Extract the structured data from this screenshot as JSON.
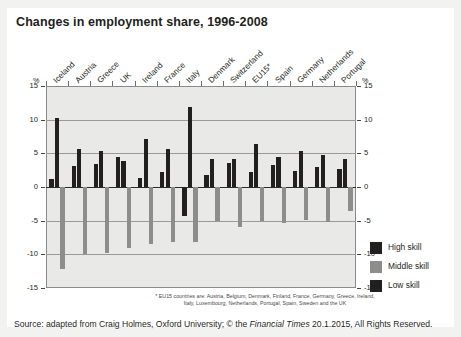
{
  "title": "Changes in employment share, 1996-2008",
  "axis": {
    "unit_symbol_left": "%",
    "unit_symbol_right": "%",
    "ticks": [
      "15",
      "10",
      "5",
      "0",
      "-5",
      "-10",
      "-15"
    ],
    "tick_values": [
      15,
      10,
      5,
      0,
      -5,
      -10,
      -15
    ],
    "min": -15,
    "max": 15
  },
  "legend": {
    "items": [
      {
        "label": "High skill",
        "color": "#221f1f"
      },
      {
        "label": "Middle skill",
        "color": "#8d8d8b"
      },
      {
        "label": "Low skill",
        "color": "#221f1f"
      }
    ]
  },
  "footnote": "* EU15 countries are: Austria, Belgium, Denmark, Finland, France, Germany, Greece, Ireland, Italy, Luxembourg, Netherlands, Portugal, Spain, Sweden and the UK",
  "source": {
    "prefix": "Source: adapted from Craig Holmes, Oxford University; © the ",
    "italic": "Financial Times",
    "suffix": " 20.1.2015, All Rights Reserved."
  },
  "chart_data": {
    "type": "bar",
    "title": "Changes in employment share, 1996-2008",
    "xlabel": "",
    "ylabel": "%",
    "ylim": [
      -15,
      15
    ],
    "grid": true,
    "legend_position": "right",
    "categories": [
      "Iceland",
      "Austria",
      "Greece",
      "UK",
      "Ireland",
      "France",
      "Italy",
      "Denmark",
      "Switzerland",
      "EU15*",
      "Spain",
      "Germany",
      "Netherlands",
      "Portugal"
    ],
    "series": [
      {
        "name": "Low skill",
        "color": "#221f1f",
        "values": [
          1.2,
          3.1,
          3.4,
          4.5,
          1.3,
          2.3,
          -4.3,
          1.8,
          3.5,
          2.2,
          3.2,
          2.4,
          3.0,
          2.6
        ]
      },
      {
        "name": "High skill",
        "color": "#221f1f",
        "values": [
          10.2,
          5.7,
          5.4,
          3.9,
          7.2,
          5.7,
          11.9,
          4.2,
          4.2,
          6.4,
          4.5,
          5.3,
          4.8,
          4.1
        ]
      },
      {
        "name": "Middle skill",
        "color": "#8d8d8b",
        "values": [
          -12.2,
          -9.9,
          -9.8,
          -9.0,
          -8.5,
          -8.1,
          -8.1,
          -5.1,
          -6.0,
          -5.1,
          -5.3,
          -4.9,
          -5.2,
          -3.6
        ]
      }
    ]
  }
}
